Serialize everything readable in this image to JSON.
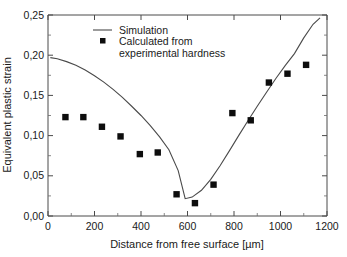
{
  "chart_data": {
    "type": "scatter",
    "title": "",
    "xlabel": "Distance from free surface [µm]",
    "ylabel": "Equivalent plastic strain",
    "xlim": [
      0,
      1200
    ],
    "ylim": [
      0.0,
      0.25
    ],
    "xticks": [
      0,
      200,
      400,
      600,
      800,
      1000,
      1200
    ],
    "xticklabels": [
      "0",
      "200",
      "400",
      "600",
      "800",
      "1000",
      "1200"
    ],
    "yticks": [
      0.0,
      0.05,
      0.1,
      0.15,
      0.2,
      0.25
    ],
    "yticklabels": [
      "0,00",
      "0,05",
      "0,10",
      "0,15",
      "0,20",
      "0,25"
    ],
    "grid": false,
    "decimal_separator": ",",
    "legend_position": "upper center",
    "series": [
      {
        "name": "Simulation",
        "type": "line",
        "color": "#4a4a4a",
        "x": [
          10,
          40,
          80,
          120,
          160,
          200,
          240,
          280,
          320,
          360,
          400,
          440,
          480,
          520,
          560,
          590,
          620,
          660,
          700,
          740,
          780,
          820,
          860,
          900,
          940,
          980,
          1020,
          1060,
          1100,
          1140,
          1170
        ],
        "y": [
          0.197,
          0.1955,
          0.192,
          0.1875,
          0.1815,
          0.1745,
          0.1665,
          0.1575,
          0.1475,
          0.1365,
          0.125,
          0.1125,
          0.0985,
          0.0825,
          0.0565,
          0.0215,
          0.0235,
          0.032,
          0.0455,
          0.0625,
          0.081,
          0.1,
          0.1185,
          0.1365,
          0.154,
          0.171,
          0.187,
          0.202,
          0.2215,
          0.2385,
          0.2465
        ]
      },
      {
        "name": "Calculated from experimental hardness",
        "type": "scatter",
        "color": "#0d0d0d",
        "marker": "square",
        "x": [
          75,
          152,
          232,
          312,
          395,
          472,
          553,
          632,
          712,
          793,
          872,
          950,
          1030,
          1110
        ],
        "y": [
          0.123,
          0.123,
          0.111,
          0.099,
          0.077,
          0.079,
          0.027,
          0.016,
          0.039,
          0.128,
          0.119,
          0.166,
          0.177,
          0.188
        ]
      }
    ]
  },
  "legend": {
    "entries": [
      {
        "label": "Simulation",
        "symbol": "line"
      },
      {
        "label": "Calculated from",
        "label2": "experimental hardness",
        "symbol": "square"
      }
    ]
  },
  "axes": {
    "x_title": "Distance from free surface [µm]",
    "y_title": "Equivalent plastic strain"
  }
}
